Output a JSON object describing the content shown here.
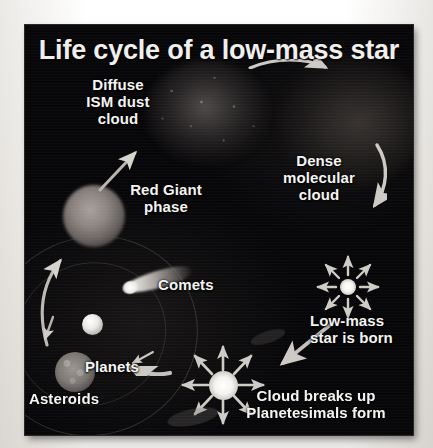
{
  "figure": {
    "title": "Life cycle of a low-mass star",
    "background_color": "#070608",
    "label_color": "#f4f4f2",
    "frame_border_color": "#2a2724",
    "page_background": "#f2f1ef"
  },
  "labels": {
    "diffuse_ism_dust_cloud": "Diffuse\nISM dust\ncloud",
    "red_giant_phase": "Red Giant\nphase",
    "dense_molecular_cloud": "Dense\nmolecular\ncloud",
    "comets": "Comets",
    "low_mass_star_is_born": "Low-mass\nstar is born",
    "planets": "Planets",
    "asteroids": "Asteroids",
    "cloud_breaks_up": "Cloud breaks up\nPlanetesimals form"
  },
  "icons": {
    "arrow_top_curved": "curved-arrow-right-icon",
    "arrow_right_curved": "curved-arrow-down-icon",
    "arrow_left_curved": "curved-arrow-up-icon",
    "arrow_red_giant": "arrow-up-right-icon",
    "arrow_star_born": "arrow-down-left-icon",
    "arrow_asteroids": "arrow-left-icon",
    "arrow_planets": "arrow-down-left-small-icon",
    "starburst_upper": "starburst-8-ray-icon",
    "starburst_lower": "starburst-8-ray-icon"
  },
  "objects": {
    "dust_cloud": "diffuse-ism-dust-cloud",
    "molecular_cloud": "dense-molecular-cloud",
    "red_giant": "red-giant-star",
    "comet": "comet-with-tail",
    "planet_small": "planet-small",
    "planet_large": "planet-large",
    "protostar_upper": "newborn-low-mass-star",
    "protostar_lower": "protostar-with-planetesimal-disk"
  }
}
